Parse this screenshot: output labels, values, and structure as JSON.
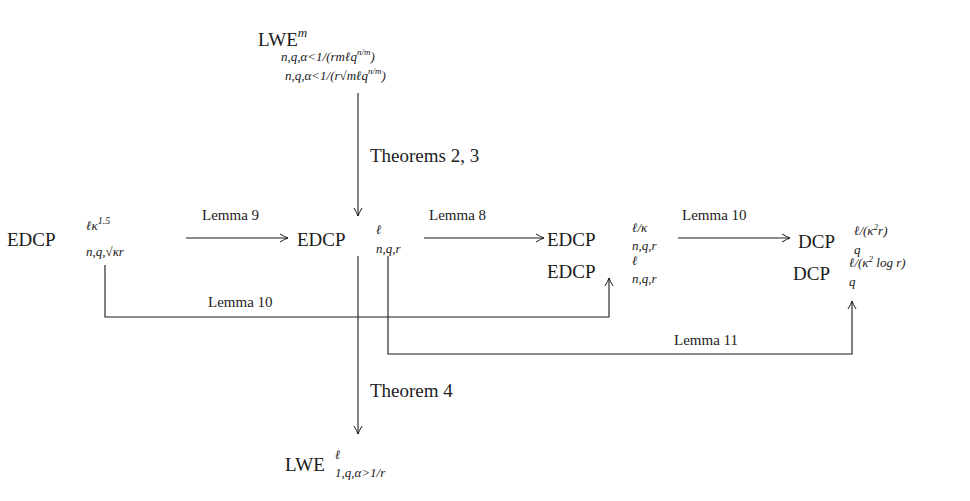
{
  "nodes": {
    "lwe_m": {
      "base": "LWE",
      "sup": "m",
      "sub1": "n,q,α<1/(rmℓq",
      "sub1_exp": "n/m",
      "sub1_close": ")",
      "sub2": "n,q,α<1/(r√mℓq",
      "sub2_exp": "n/m",
      "sub2_close": ")"
    },
    "edcp_left": {
      "base": "EDCP",
      "sup": "ℓκ",
      "sup_exp": "1.5",
      "sub": "n,q,√κr"
    },
    "edcp_center": {
      "base": "EDCP",
      "sup": "ℓ",
      "sub": "n,q,r"
    },
    "edcp_right_top": {
      "base": "EDCP",
      "sup": "ℓ/κ",
      "sub": "n,q,r"
    },
    "edcp_right_bottom": {
      "base": "EDCP",
      "sup": "ℓ",
      "sub": "n,q,r"
    },
    "dcp_top": {
      "base": "DCP",
      "sup": "ℓ/(κ",
      "sup_exp": "2",
      "sup_close": "r)",
      "sub": "q"
    },
    "dcp_bottom": {
      "base": "DCP",
      "sup": "ℓ/(κ",
      "sup_exp": "2",
      "sup_close": " log r)",
      "sub": "q"
    },
    "lwe_l": {
      "base": "LWE",
      "sup": "ℓ",
      "sub": "1,q,α>1/r"
    }
  },
  "edges": {
    "theorems_2_3": "Theorems 2, 3",
    "lemma_9": "Lemma 9",
    "lemma_8": "Lemma 8",
    "lemma_10_top": "Lemma 10",
    "lemma_10_bottom": "Lemma 10",
    "lemma_11": "Lemma 11",
    "theorem_4": "Theorem 4"
  },
  "colors": {
    "ink": "#1a1a1a",
    "background": "#ffffff"
  }
}
